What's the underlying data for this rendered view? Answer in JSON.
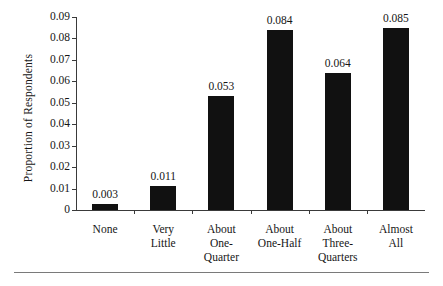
{
  "chart_data": {
    "type": "bar",
    "title": "",
    "xlabel": "",
    "ylabel": "Proportion of Respondents",
    "categories": [
      "None",
      "Very Little",
      "About One-Quarter",
      "About One-Half",
      "About Three-Quarters",
      "Almost All"
    ],
    "category_lines": [
      [
        "None"
      ],
      [
        "Very",
        "Little"
      ],
      [
        "About",
        "One-",
        "Quarter"
      ],
      [
        "About",
        "One-Half"
      ],
      [
        "About",
        "Three-",
        "Quarters"
      ],
      [
        "Almost",
        "All"
      ]
    ],
    "values": [
      0.003,
      0.011,
      0.053,
      0.084,
      0.064,
      0.085
    ],
    "value_labels": [
      "0.003",
      "0.011",
      "0.053",
      "0.084",
      "0.064",
      "0.085"
    ],
    "ylim": [
      0,
      0.09
    ],
    "ytick_values": [
      0.09,
      0.08,
      0.07,
      0.06,
      0.05,
      0.04,
      0.03,
      0.02,
      0.01,
      0
    ],
    "ytick_labels": [
      "0.09",
      "0.08",
      "0.07",
      "0.06",
      "0.05",
      "0.04",
      "0.03",
      "0.02",
      "0.01",
      "0"
    ],
    "grid": false,
    "legend": null,
    "bar_color": "#111111",
    "axis_color": "#3a3a3a",
    "text_color": "#161616"
  }
}
